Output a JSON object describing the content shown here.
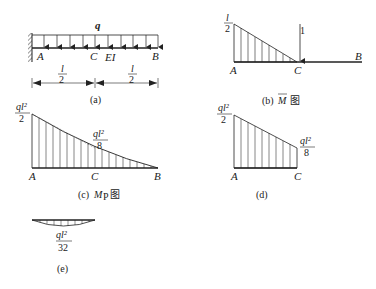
{
  "figure_a": {
    "load_label": "q",
    "points": {
      "A": "A",
      "C": "C",
      "B": "B"
    },
    "stiffness_label": "EI",
    "span_left": {
      "num": "l",
      "den": "2"
    },
    "span_right": {
      "num": "l",
      "den": "2"
    },
    "caption": "(a)"
  },
  "figure_b": {
    "peak": {
      "num": "l",
      "den": "2"
    },
    "unit_load": "1",
    "points": {
      "A": "A",
      "C": "C",
      "B": "B"
    },
    "caption_prefix": "(b)",
    "caption_symbol": "M",
    "caption_suffix": "图"
  },
  "figure_c": {
    "peak": {
      "num": "ql²",
      "den": "2"
    },
    "mid": {
      "num": "ql²",
      "den": "8"
    },
    "points": {
      "A": "A",
      "C": "C",
      "B": "B"
    },
    "caption_prefix": "(c)",
    "caption_symbol": "M",
    "caption_sub": "P",
    "caption_suffix": "图"
  },
  "figure_d": {
    "peak": {
      "num": "ql²",
      "den": "2"
    },
    "end": {
      "num": "ql²",
      "den": "8"
    },
    "points": {
      "A": "A",
      "C": "C"
    },
    "caption": "(d)"
  },
  "figure_e": {
    "value": {
      "num": "ql²",
      "den": "32"
    },
    "caption": "(e)"
  }
}
